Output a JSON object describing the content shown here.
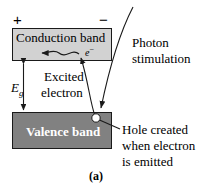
{
  "figure": {
    "caption": "(a)",
    "polarity": {
      "positive": "+",
      "negative": "−"
    },
    "bands": {
      "conduction": {
        "label": "Conduction band",
        "fill": "#d2d2d2",
        "text_color": "#000000"
      },
      "valence": {
        "label": "Valence band",
        "fill": "#818181",
        "text_color": "#ffffff"
      }
    },
    "bandgap": {
      "symbol": "E",
      "subscript": "g"
    },
    "carriers": {
      "electron_symbol": "e",
      "electron_charge": "−",
      "hole_fill": "#ffffff"
    },
    "annotations": {
      "excited_electron": {
        "line1": "Excited",
        "line2": "electron"
      },
      "photon_stimulation": {
        "line1": "Photon",
        "line2": "stimulation"
      },
      "hole_created": {
        "line1": "Hole created",
        "line2": "when electron",
        "line3": "is emitted"
      }
    },
    "colors": {
      "stroke": "#1a1a1a",
      "background": "#ffffff"
    }
  }
}
